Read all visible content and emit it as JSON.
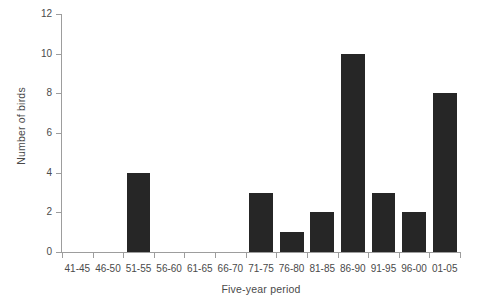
{
  "chart_data": {
    "type": "bar",
    "title": "",
    "subtitle": "",
    "xlabel": "Five-year period",
    "ylabel": "Number of birds",
    "categories": [
      "41-45",
      "46-50",
      "51-55",
      "56-60",
      "61-65",
      "66-70",
      "71-75",
      "76-80",
      "81-85",
      "86-90",
      "91-95",
      "96-00",
      "01-05"
    ],
    "values": [
      0,
      0,
      4,
      0,
      0,
      0,
      3,
      1,
      2,
      10,
      3,
      2,
      8
    ],
    "ylim": [
      0,
      12
    ],
    "yticks": [
      0,
      2,
      4,
      6,
      8,
      10,
      12
    ],
    "ytick_labels": [
      "0",
      "2",
      "4",
      "6",
      "8",
      "10",
      "12"
    ],
    "grid": false,
    "legend": false,
    "legend_position": "none",
    "bar_color": "#262626",
    "axis_color": "#9d9d9d",
    "text_color": "#4a4a4a",
    "background_color": "#ffffff"
  }
}
